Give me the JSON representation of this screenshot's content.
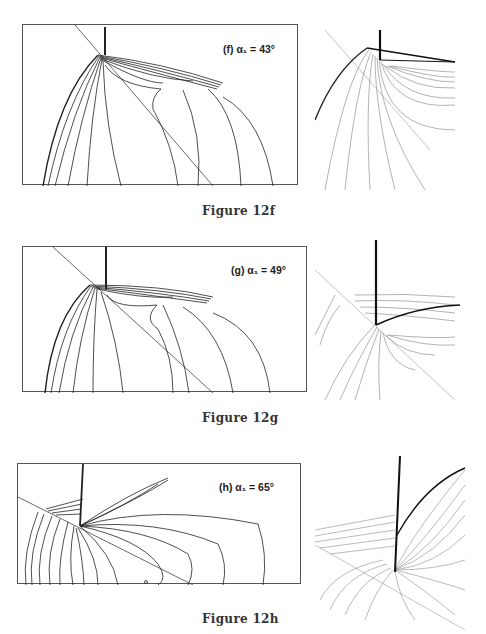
{
  "figures": [
    {
      "id": "12f",
      "caption": "Figure 12f",
      "panel_label": "(f) α₁ = 43°",
      "angle_deg": 43
    },
    {
      "id": "12g",
      "caption": "Figure 12g",
      "panel_label": "(g) α₁ = 49°",
      "angle_deg": 49
    },
    {
      "id": "12h",
      "caption": "Figure 12h",
      "panel_label": "(h) α₁ = 65°",
      "angle_deg": 65
    }
  ],
  "colors": {
    "line": "#222222",
    "thin_line": "#555555",
    "border": "#555555",
    "background": "#ffffff"
  }
}
